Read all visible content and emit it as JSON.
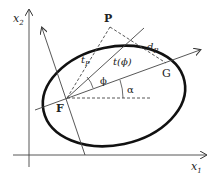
{
  "diagram": {
    "axes": {
      "x_label": "x",
      "x_sub": "1",
      "y_label": "x",
      "y_sub": "2"
    },
    "points": {
      "P": "P",
      "F": "F",
      "G": "G"
    },
    "labels": {
      "tP": "t",
      "tP_sub": "P",
      "dP": "d",
      "dP_sub": "P",
      "t_phi": "t(ϕ)",
      "phi": "ϕ",
      "alpha": "α"
    },
    "colors": {
      "ellipse": "#111111",
      "lines": "#333333",
      "background": "#ffffff"
    }
  }
}
